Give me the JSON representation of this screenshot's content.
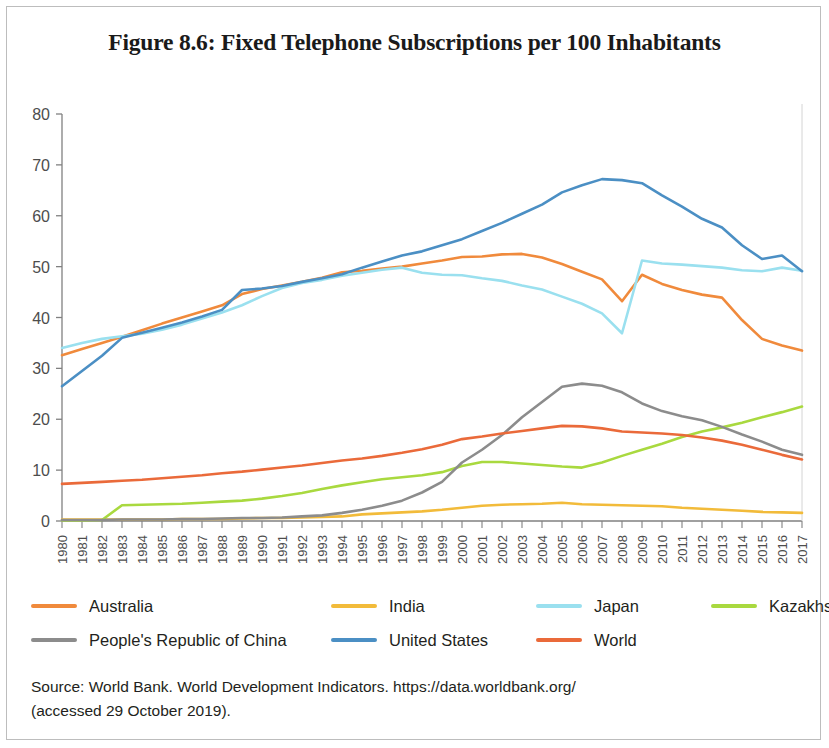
{
  "figure": {
    "title": "Figure 8.6: Fixed Telephone Subscriptions per 100 Inhabitants",
    "source_line1": "Source: World Bank. World Development Indicators. https://data.worldbank.org/",
    "source_line2": "(accessed 29 October 2019)."
  },
  "colors": {
    "australia": "#f08a3c",
    "india": "#f2bb3a",
    "japan": "#9ae0ef",
    "kazakhstan": "#a9d93f",
    "china": "#8c8c8c",
    "united_states": "#4b8fc4",
    "world": "#ea6a3a",
    "axis": "#808080",
    "frame": "#bdbdbd"
  },
  "legend": {
    "row1": [
      {
        "label": "Australia",
        "color_key": "australia"
      },
      {
        "label": "India",
        "color_key": "india"
      },
      {
        "label": "Japan",
        "color_key": "japan"
      },
      {
        "label": "Kazakhstan",
        "color_key": "kazakhstan"
      }
    ],
    "row2": [
      {
        "label": "People's Republic of China",
        "color_key": "china"
      },
      {
        "label": "United States",
        "color_key": "united_states"
      },
      {
        "label": "World",
        "color_key": "world"
      }
    ]
  },
  "chart_data": {
    "type": "line",
    "title": "Figure 8.6: Fixed Telephone Subscriptions per 100 Inhabitants",
    "xlabel": "",
    "ylabel": "",
    "ylim": [
      0,
      80
    ],
    "yticks": [
      0,
      10,
      20,
      30,
      40,
      50,
      60,
      70,
      80
    ],
    "grid": false,
    "legend_position": "bottom",
    "x": [
      1980,
      1981,
      1982,
      1983,
      1984,
      1985,
      1986,
      1987,
      1988,
      1989,
      1990,
      1991,
      1992,
      1993,
      1994,
      1995,
      1996,
      1997,
      1998,
      1999,
      2000,
      2001,
      2002,
      2003,
      2004,
      2005,
      2006,
      2007,
      2008,
      2009,
      2010,
      2011,
      2012,
      2013,
      2014,
      2015,
      2016,
      2017
    ],
    "categories": [
      "1980",
      "1981",
      "1982",
      "1983",
      "1984",
      "1985",
      "1986",
      "1987",
      "1988",
      "1989",
      "1990",
      "1991",
      "1992",
      "1993",
      "1994",
      "1995",
      "1996",
      "1997",
      "1998",
      "1999",
      "2000",
      "2001",
      "2002",
      "2003",
      "2004",
      "2005",
      "2006",
      "2007",
      "2008",
      "2009",
      "2010",
      "2011",
      "2012",
      "2013",
      "2014",
      "2015",
      "2016",
      "2017"
    ],
    "series": [
      {
        "name": "Australia",
        "color": "#f08a3c",
        "values": [
          32.6,
          33.8,
          35.0,
          36.2,
          37.5,
          38.8,
          40.0,
          41.2,
          42.4,
          44.6,
          45.6,
          46.3,
          47.0,
          47.8,
          48.9,
          49.2,
          49.6,
          50.0,
          50.6,
          51.2,
          51.9,
          52.0,
          52.4,
          52.5,
          51.8,
          50.5,
          49.0,
          47.5,
          43.2,
          48.4,
          46.6,
          45.4,
          44.5,
          43.9,
          39.5,
          35.8,
          34.5,
          33.5
        ]
      },
      {
        "name": "India",
        "color": "#f2bb3a",
        "values": [
          0.3,
          0.3,
          0.3,
          0.3,
          0.3,
          0.3,
          0.4,
          0.4,
          0.4,
          0.5,
          0.6,
          0.6,
          0.7,
          0.8,
          0.9,
          1.3,
          1.5,
          1.7,
          1.9,
          2.2,
          2.6,
          3.0,
          3.2,
          3.3,
          3.4,
          3.6,
          3.3,
          3.2,
          3.1,
          3.0,
          2.9,
          2.6,
          2.4,
          2.2,
          2.0,
          1.8,
          1.7,
          1.6
        ]
      },
      {
        "name": "Japan",
        "color": "#9ae0ef",
        "values": [
          34.0,
          35.0,
          35.8,
          36.3,
          36.8,
          37.6,
          38.6,
          39.8,
          41.0,
          42.4,
          44.2,
          45.8,
          46.8,
          47.4,
          48.2,
          48.8,
          49.4,
          49.8,
          48.8,
          48.4,
          48.3,
          47.7,
          47.2,
          46.3,
          45.5,
          44.1,
          42.7,
          40.8,
          36.9,
          51.2,
          50.6,
          50.4,
          50.1,
          49.8,
          49.3,
          49.1,
          49.8,
          49.2
        ]
      },
      {
        "name": "Kazakhstan",
        "color": "#a9d93f",
        "values": [
          0.1,
          0.1,
          0.2,
          3.1,
          3.2,
          3.3,
          3.4,
          3.6,
          3.8,
          4.0,
          4.4,
          4.9,
          5.5,
          6.3,
          7.0,
          7.6,
          8.2,
          8.6,
          9.0,
          9.6,
          10.8,
          11.6,
          11.6,
          11.3,
          11.0,
          10.7,
          10.5,
          11.5,
          12.8,
          14.0,
          15.2,
          16.5,
          17.6,
          18.4,
          19.3,
          20.4,
          21.4,
          22.5
        ]
      },
      {
        "name": "People's Republic of China",
        "color": "#8c8c8c",
        "values": [
          0.2,
          0.2,
          0.2,
          0.3,
          0.3,
          0.3,
          0.4,
          0.4,
          0.5,
          0.6,
          0.6,
          0.7,
          0.9,
          1.1,
          1.6,
          2.2,
          3.0,
          4.0,
          5.6,
          7.7,
          11.5,
          14.0,
          16.9,
          20.4,
          23.4,
          26.4,
          27.0,
          26.6,
          25.3,
          23.1,
          21.6,
          20.6,
          19.8,
          18.5,
          17.0,
          15.6,
          14.0,
          13.0
        ]
      },
      {
        "name": "United States",
        "color": "#4b8fc4",
        "values": [
          26.5,
          29.5,
          32.5,
          36.0,
          37.0,
          38.0,
          39.0,
          40.2,
          41.5,
          45.4,
          45.7,
          46.2,
          47.0,
          47.7,
          48.5,
          49.8,
          51.0,
          52.2,
          53.0,
          54.2,
          55.4,
          57.0,
          58.6,
          60.4,
          62.2,
          64.6,
          66.0,
          67.2,
          67.0,
          66.4,
          64.0,
          61.8,
          59.4,
          57.7,
          54.2,
          51.5,
          52.2,
          49.1
        ]
      },
      {
        "name": "World",
        "color": "#ea6a3a",
        "values": [
          7.3,
          7.5,
          7.7,
          7.9,
          8.1,
          8.4,
          8.7,
          9.0,
          9.4,
          9.7,
          10.1,
          10.5,
          10.9,
          11.4,
          11.9,
          12.3,
          12.8,
          13.4,
          14.1,
          15.0,
          16.1,
          16.6,
          17.2,
          17.7,
          18.2,
          18.7,
          18.6,
          18.2,
          17.6,
          17.4,
          17.2,
          16.9,
          16.4,
          15.8,
          15.0,
          14.0,
          13.0,
          12.1
        ]
      }
    ]
  }
}
